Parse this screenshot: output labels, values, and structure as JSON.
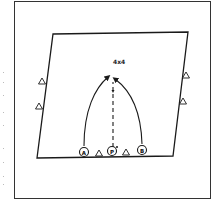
{
  "diagram": {
    "type": "drill-diagram",
    "drill_label": "4x4",
    "colors": {
      "line": "#1a1a1a",
      "background": "#ffffff",
      "frame": "#333333"
    },
    "field": {
      "shape": "parallelogram",
      "corners": [
        [
          53,
          34
        ],
        [
          188,
          32
        ],
        [
          173,
          156
        ],
        [
          37,
          158
        ]
      ]
    },
    "cones": [
      {
        "id": "cone-left-1",
        "x": 42,
        "y": 82
      },
      {
        "id": "cone-left-2",
        "x": 39,
        "y": 107
      },
      {
        "id": "cone-right-1",
        "x": 186,
        "y": 76
      },
      {
        "id": "cone-right-2",
        "x": 183,
        "y": 102
      },
      {
        "id": "cone-bottom-1",
        "x": 99,
        "y": 154
      },
      {
        "id": "cone-bottom-2",
        "x": 126,
        "y": 153
      }
    ],
    "players": [
      {
        "id": "player-a",
        "label": "A",
        "x": 84,
        "y": 152
      },
      {
        "id": "player-p",
        "label": "P",
        "x": 112,
        "y": 151
      },
      {
        "id": "player-b",
        "label": "B",
        "x": 142,
        "y": 150
      }
    ],
    "paths": [
      {
        "id": "run-a",
        "from": "A",
        "style": "solid-curve-arrow"
      },
      {
        "id": "run-b",
        "from": "B",
        "style": "solid-curve-arrow"
      },
      {
        "id": "pass-p",
        "from": "P",
        "style": "dashed-arrow"
      }
    ]
  }
}
